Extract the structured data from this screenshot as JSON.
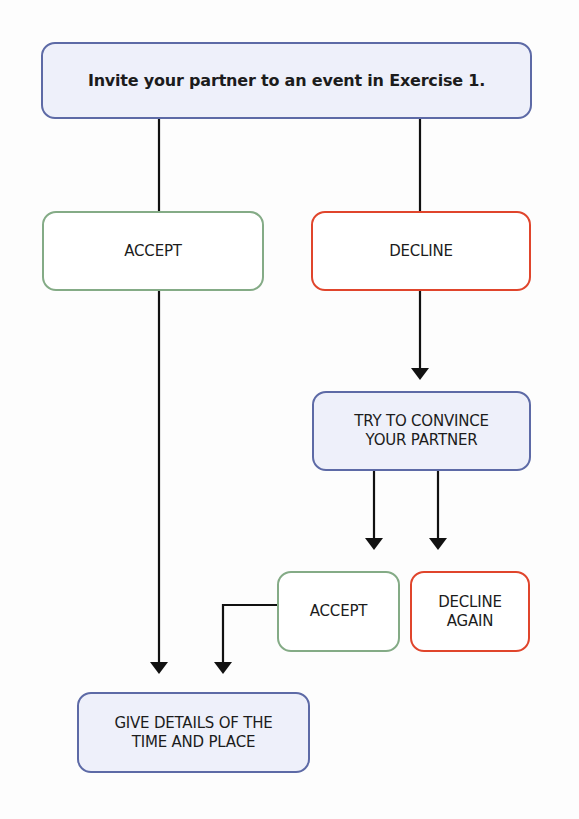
{
  "diagram": {
    "title_box": "Invite your partner to an event in Exercise 1.",
    "accept_1": "ACCEPT",
    "decline_1": "DECLINE",
    "convince": "TRY TO CONVINCE YOUR PARTNER",
    "accept_2": "ACCEPT",
    "decline_again": "DECLINE AGAIN",
    "give_details": "GIVE DETAILS OF THE TIME AND PLACE"
  },
  "colors": {
    "blue_border": "#5d6aa6",
    "blue_fill": "#eef0fa",
    "green_border": "#84ab86",
    "red_border": "#e0452c",
    "line": "#111111"
  }
}
